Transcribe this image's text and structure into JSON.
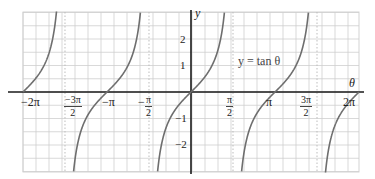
{
  "chart_data": {
    "type": "line",
    "title": "",
    "function": "y = tan θ",
    "legend_label": "y = tan θ",
    "xlabel": "θ",
    "ylabel": "y",
    "xlim": [
      -6.2832,
      6.2832
    ],
    "ylim": [
      -3,
      3
    ],
    "grid": true,
    "x_ticks": [
      {
        "value": -6.2832,
        "label": "−2π"
      },
      {
        "value": -4.7124,
        "label": "−3π/2",
        "num": "−3π",
        "den": "2"
      },
      {
        "value": -3.1416,
        "label": "−π"
      },
      {
        "value": -1.5708,
        "label": "−π/2",
        "num": "π",
        "den": "2",
        "sign": "−"
      },
      {
        "value": 1.5708,
        "label": "π/2",
        "num": "π",
        "den": "2"
      },
      {
        "value": 3.1416,
        "label": "π"
      },
      {
        "value": 4.7124,
        "label": "3π/2",
        "num": "3π",
        "den": "2"
      },
      {
        "value": 6.2832,
        "label": "2π"
      }
    ],
    "y_ticks": [
      {
        "value": 2,
        "label": "2"
      },
      {
        "value": 1,
        "label": "1"
      },
      {
        "value": -1,
        "label": "−1"
      },
      {
        "value": -2,
        "label": "−2"
      }
    ],
    "asymptotes": [
      -4.7124,
      -1.5708,
      1.5708,
      4.7124
    ],
    "series": [
      {
        "name": "tan θ",
        "branch": "(-2π, -3π/2)",
        "x": [
          -6.2832,
          -5.5,
          -5.0,
          -4.8
        ],
        "y": [
          0,
          1.0,
          3.38,
          11.4
        ]
      },
      {
        "name": "tan θ",
        "branch": "(-3π/2, -π/2)",
        "x": [
          -4.6,
          -4.0,
          -3.1416,
          -2.3,
          -1.7
        ],
        "y": [
          -8.9,
          -1.16,
          0,
          1.12,
          7.7
        ]
      },
      {
        "name": "tan θ",
        "branch": "(-π/2, π/2)",
        "x": [
          -1.3,
          -0.785,
          0,
          0.785,
          1.3
        ],
        "y": [
          -3.6,
          -1,
          0,
          1,
          3.6
        ]
      },
      {
        "name": "tan θ",
        "branch": "(π/2, 3π/2)",
        "x": [
          1.7,
          2.356,
          3.1416,
          3.927,
          4.6
        ],
        "y": [
          -7.7,
          -1,
          0,
          1,
          8.9
        ]
      },
      {
        "name": "tan θ",
        "branch": "(3π/2, 2π)",
        "x": [
          4.8,
          5.5,
          6.2832
        ],
        "y": [
          -11.4,
          -0.85,
          0
        ]
      }
    ],
    "colors": {
      "curve": "#6e6e6e",
      "axis": "#1a1a1a",
      "grid": "#cfcfcf",
      "grid_dotted": "#bdbdbd"
    }
  }
}
